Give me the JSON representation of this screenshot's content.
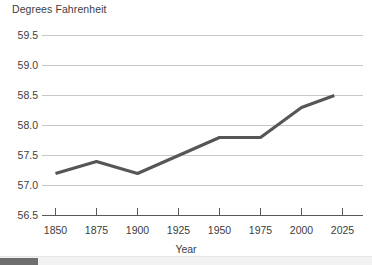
{
  "chart_data": {
    "type": "line",
    "title": "",
    "ylabel": "Degrees Fahrenheit",
    "xlabel": "Year",
    "x": [
      1850,
      1875,
      1900,
      1950,
      1975,
      2000,
      2020
    ],
    "values": [
      57.2,
      57.4,
      57.2,
      57.8,
      57.8,
      58.3,
      58.5
    ],
    "series": [
      {
        "name": "Global average temperature",
        "x": [
          1850,
          1875,
          1900,
          1950,
          1975,
          2000,
          2020
        ],
        "values": [
          57.2,
          57.4,
          57.2,
          57.8,
          57.8,
          58.3,
          58.5
        ]
      }
    ],
    "xlim": [
      1840,
      2035
    ],
    "ylim": [
      56.5,
      59.5
    ],
    "y_ticks": [
      56.5,
      57.0,
      57.5,
      58.0,
      58.5,
      59.0,
      59.5
    ],
    "y_tick_labels": [
      "56.5",
      "57.0",
      "57.5",
      "58.0",
      "58.5",
      "59.0",
      "59.5"
    ],
    "x_ticks": [
      1850,
      1875,
      1900,
      1925,
      1950,
      1975,
      2000,
      2025
    ],
    "x_tick_labels": [
      "1850",
      "1875",
      "1900",
      "1925",
      "1950",
      "1975",
      "2000",
      "2025"
    ],
    "grid": "horizontal",
    "legend": "none",
    "line_color": "#565656",
    "gridline_color": "#c8c8c8",
    "axis_color": "#595959",
    "background_color": "#ffffff"
  },
  "axis": {
    "y_title": "Degrees Fahrenheit",
    "x_title": "Year",
    "y_labels": {
      "t0": "56.5",
      "t1": "57.0",
      "t2": "57.5",
      "t3": "58.0",
      "t4": "58.5",
      "t5": "59.0",
      "t6": "59.5"
    },
    "x_labels": {
      "t0": "1850",
      "t1": "1875",
      "t2": "1900",
      "t3": "1925",
      "t4": "1950",
      "t5": "1975",
      "t6": "2000",
      "t7": "2025"
    }
  },
  "scrollbar": {
    "orientation": "horizontal",
    "position": "bottom"
  }
}
